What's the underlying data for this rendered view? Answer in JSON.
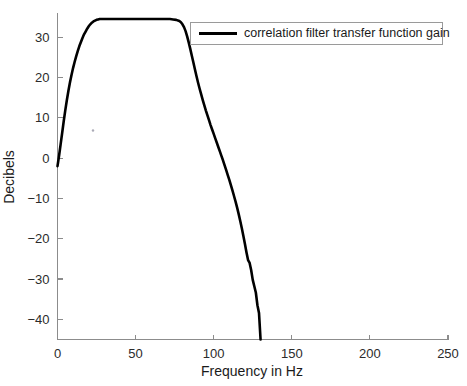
{
  "chart_data": {
    "type": "line",
    "title": "",
    "xlabel": "Frequency in Hz",
    "ylabel": "Decibels",
    "xlim": [
      0,
      250
    ],
    "ylim": [
      -45,
      36
    ],
    "xticks": [
      0,
      50,
      100,
      150,
      200,
      250
    ],
    "yticks": [
      -40,
      -30,
      -20,
      -10,
      0,
      10,
      20,
      30
    ],
    "xtick_labels": [
      "0",
      "50",
      "100",
      "150",
      "200",
      "250"
    ],
    "ytick_labels": [
      "-40",
      "-30",
      "-20",
      "-10",
      "0",
      "10",
      "20",
      "30"
    ],
    "grid": false,
    "legend_position": "top-right",
    "series": [
      {
        "name": "correlation filter transfer function gain",
        "color": "#000000",
        "line_width": 2.6,
        "x": [
          0,
          1,
          2,
          3,
          4,
          5,
          6,
          7,
          8,
          9,
          10,
          11,
          12,
          13,
          14,
          15,
          16,
          17,
          18,
          19,
          20,
          21,
          22,
          23,
          24,
          25,
          26,
          27,
          28,
          30,
          32,
          35,
          40,
          45,
          50,
          55,
          60,
          65,
          70,
          72,
          74,
          76,
          78,
          79,
          80,
          81,
          82,
          83,
          84,
          85,
          86,
          87,
          88,
          89,
          90,
          91,
          92,
          93,
          94,
          95,
          96,
          97,
          98,
          99,
          100,
          101,
          102,
          103,
          104,
          105,
          106,
          107,
          108,
          109,
          110,
          111,
          112,
          113,
          114,
          115,
          116,
          117,
          118,
          119,
          120,
          121,
          122,
          123,
          124,
          125,
          126,
          127,
          128,
          129,
          130
        ],
        "y": [
          -2.0,
          0.6,
          3.4,
          6.3,
          9.2,
          11.9,
          14.4,
          16.7,
          18.8,
          20.7,
          22.4,
          23.9,
          25.3,
          26.6,
          27.8,
          28.8,
          29.8,
          30.7,
          31.4,
          32.1,
          32.7,
          33.2,
          33.6,
          33.9,
          34.1,
          34.3,
          34.4,
          34.5,
          34.5,
          34.5,
          34.5,
          34.5,
          34.5,
          34.5,
          34.5,
          34.5,
          34.5,
          34.5,
          34.5,
          34.5,
          34.4,
          34.3,
          34.0,
          33.7,
          33.2,
          32.5,
          31.5,
          30.2,
          28.7,
          27.1,
          25.4,
          23.7,
          22.0,
          20.3,
          18.7,
          17.2,
          15.8,
          14.4,
          13.1,
          11.8,
          10.6,
          9.4,
          8.2,
          7.1,
          6.0,
          4.9,
          3.8,
          2.7,
          1.6,
          0.5,
          -0.6,
          -1.8,
          -3.0,
          -4.2,
          -5.4,
          -6.7,
          -8.0,
          -9.4,
          -10.8,
          -12.3,
          -13.9,
          -15.6,
          -17.4,
          -19.3,
          -21.3,
          -23.4,
          -25.3,
          -26.0,
          -27.8,
          -30.2,
          -31.8,
          -33.4,
          -36.5,
          -38.4,
          -45.0
        ]
      }
    ],
    "annotations": []
  },
  "legend": {
    "entries": [
      {
        "label": "correlation filter transfer function gain"
      }
    ]
  },
  "axes": {
    "xlabel": "Frequency in Hz",
    "ylabel": "Decibels"
  }
}
